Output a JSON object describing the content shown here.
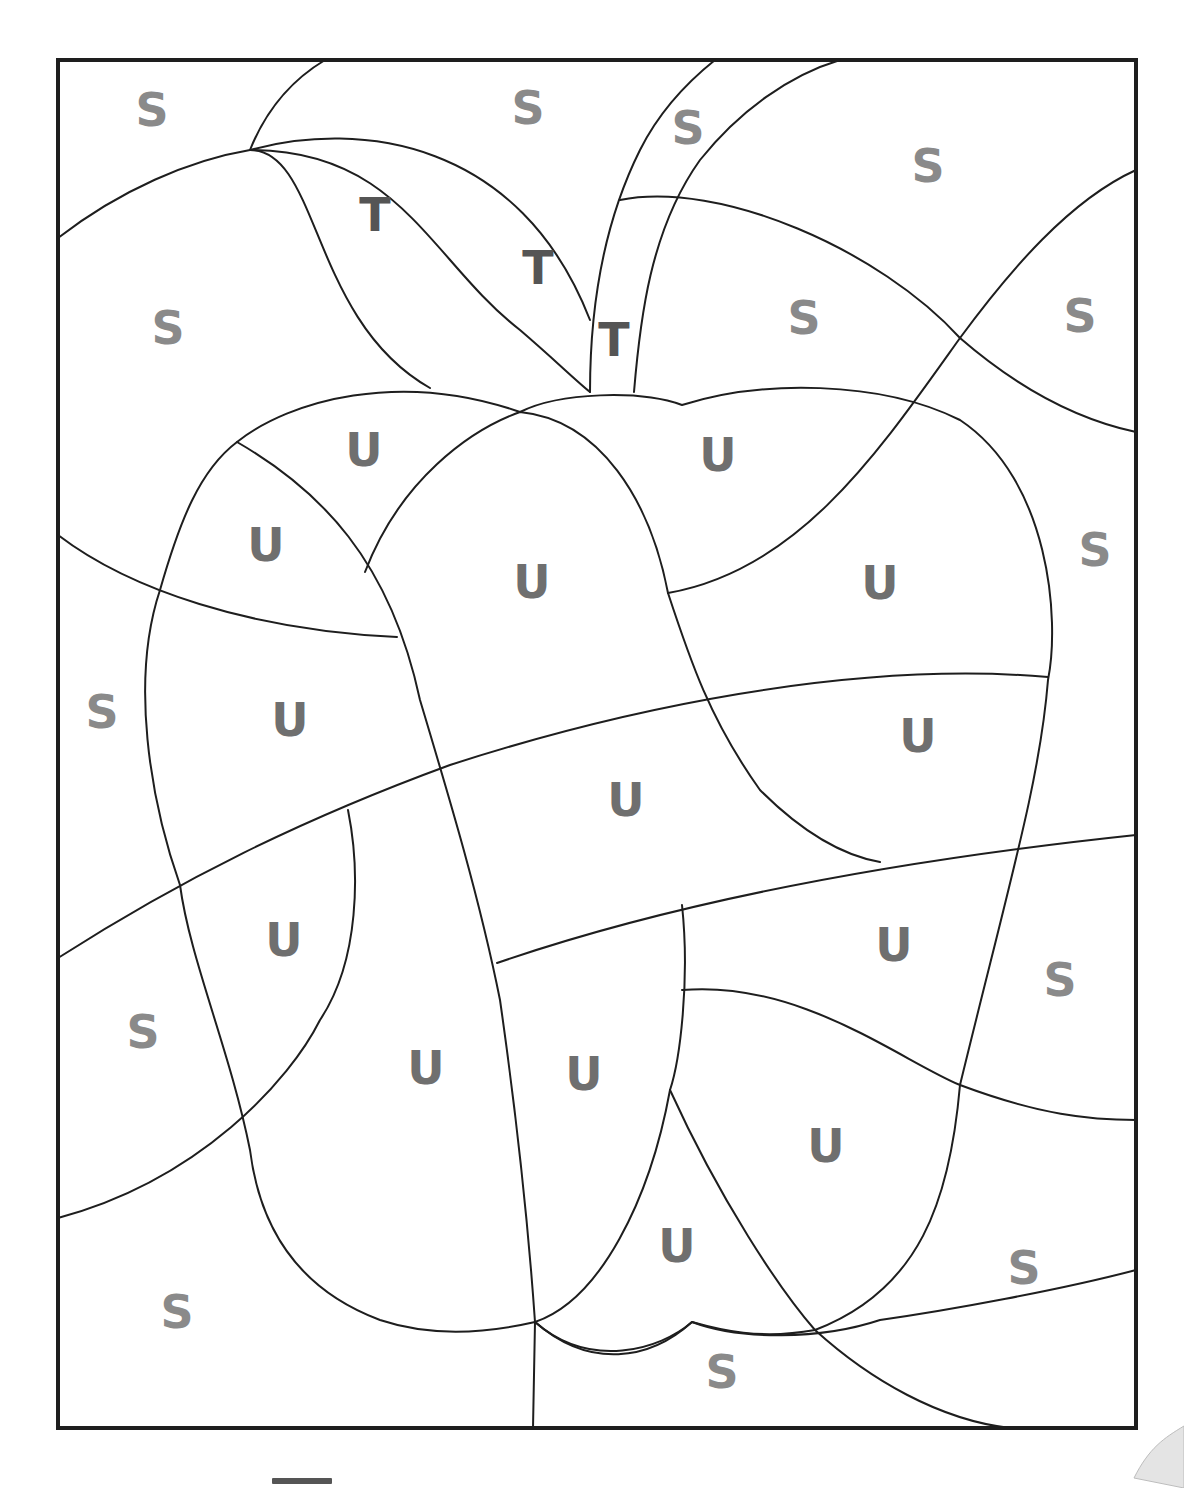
{
  "worksheet": {
    "type": "color-by-letter",
    "subject": "apple",
    "colors": {
      "frame": "#1e1e1e",
      "letter_S": "#8a8a8a",
      "letter_T": "#555555",
      "letter_U": "#6f6f6f"
    },
    "letters": [
      {
        "char": "S",
        "x": 152,
        "y": 110
      },
      {
        "char": "S",
        "x": 528,
        "y": 108
      },
      {
        "char": "S",
        "x": 688,
        "y": 128
      },
      {
        "char": "S",
        "x": 928,
        "y": 166
      },
      {
        "char": "T",
        "x": 375,
        "y": 215
      },
      {
        "char": "T",
        "x": 538,
        "y": 268
      },
      {
        "char": "T",
        "x": 614,
        "y": 340
      },
      {
        "char": "S",
        "x": 168,
        "y": 328
      },
      {
        "char": "S",
        "x": 804,
        "y": 318
      },
      {
        "char": "S",
        "x": 1080,
        "y": 316
      },
      {
        "char": "U",
        "x": 364,
        "y": 450
      },
      {
        "char": "U",
        "x": 718,
        "y": 455
      },
      {
        "char": "U",
        "x": 266,
        "y": 545
      },
      {
        "char": "U",
        "x": 532,
        "y": 582
      },
      {
        "char": "U",
        "x": 880,
        "y": 583
      },
      {
        "char": "S",
        "x": 1095,
        "y": 550
      },
      {
        "char": "S",
        "x": 102,
        "y": 712
      },
      {
        "char": "U",
        "x": 290,
        "y": 720
      },
      {
        "char": "U",
        "x": 918,
        "y": 736
      },
      {
        "char": "U",
        "x": 626,
        "y": 800
      },
      {
        "char": "U",
        "x": 284,
        "y": 940
      },
      {
        "char": "U",
        "x": 894,
        "y": 945
      },
      {
        "char": "S",
        "x": 1060,
        "y": 980
      },
      {
        "char": "S",
        "x": 143,
        "y": 1032
      },
      {
        "char": "U",
        "x": 426,
        "y": 1068
      },
      {
        "char": "U",
        "x": 584,
        "y": 1074
      },
      {
        "char": "U",
        "x": 826,
        "y": 1146
      },
      {
        "char": "U",
        "x": 677,
        "y": 1246
      },
      {
        "char": "S",
        "x": 1024,
        "y": 1268
      },
      {
        "char": "S",
        "x": 177,
        "y": 1312
      },
      {
        "char": "S",
        "x": 722,
        "y": 1372
      }
    ]
  }
}
